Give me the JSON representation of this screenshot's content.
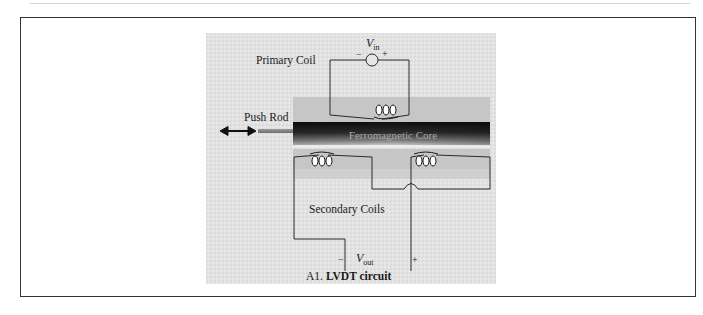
{
  "figure": {
    "caption": "A1. LVDT circuit",
    "caption_prefix": "A1.",
    "caption_title": "LVDT circuit",
    "labels": {
      "primary_coil": "Primary Coil",
      "push_rod": "Push Rod",
      "core": "Ferromagnetic Core",
      "secondary_coils": "Secondary Coils",
      "vin_base": "V",
      "vin_sub": "in",
      "vout_base": "V",
      "vout_sub": "out",
      "minus": "−",
      "plus": "+"
    },
    "colors": {
      "panel_bg": "#e4e4e4",
      "housing": "#c4c4c4",
      "core_dark": "#1c1c1c",
      "core_text": "#9a9a9a",
      "wire": "#2a2a2a"
    }
  }
}
